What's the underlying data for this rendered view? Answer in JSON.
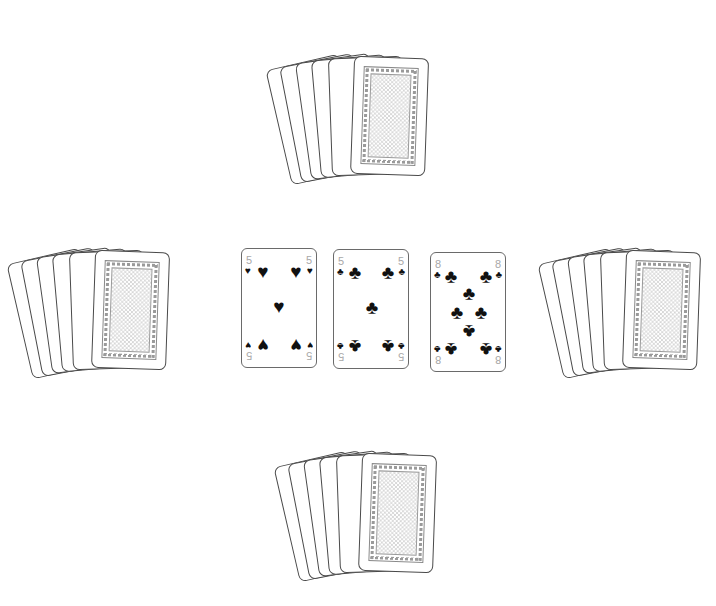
{
  "game": {
    "type": "card-table",
    "players": 4
  },
  "hands": {
    "top": {
      "card_count": 6,
      "face": "down",
      "front_center": [
        388,
        117
      ]
    },
    "left": {
      "card_count": 6,
      "face": "down",
      "front_center": [
        129,
        311
      ]
    },
    "right": {
      "card_count": 6,
      "face": "down",
      "front_center": [
        660,
        310
      ]
    },
    "bottom": {
      "card_count": 6,
      "face": "down",
      "front_center": [
        396,
        514
      ]
    }
  },
  "center_cards": [
    {
      "rank": "5",
      "suit": "hearts",
      "suit_symbol": "♥",
      "suit_symbol_flipped": "♠",
      "color": "#111111"
    },
    {
      "rank": "5",
      "suit": "clubs",
      "suit_symbol": "♣",
      "color": "#111111"
    },
    {
      "rank": "8",
      "suit": "clubs",
      "suit_symbol": "♣",
      "color": "#111111"
    }
  ],
  "colors": {
    "background": "#ffffff",
    "card_outline": "#4a4a4a",
    "rank_text": "#a8a8a8",
    "pip": "#111111",
    "back_pattern": "#d6d6d6"
  }
}
